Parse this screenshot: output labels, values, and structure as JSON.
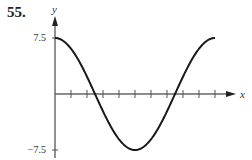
{
  "problem_number": "55.",
  "chart_data": {
    "type": "line",
    "title": "",
    "xlabel": "x",
    "ylabel": "y",
    "y_ticks": [
      {
        "value": 7.5,
        "label": "7.5"
      },
      {
        "value": -7.5,
        "label": "−7.5"
      }
    ],
    "x_tick_count": 10,
    "x_tick_labels": [],
    "ylim": [
      -7.5,
      7.5
    ],
    "xlim": [
      0,
      10
    ],
    "grid": false,
    "series": [
      {
        "name": "curve",
        "function": "y = 7.5 cos(pi x / 5)",
        "x": [
          0,
          1,
          2,
          2.5,
          3,
          4,
          5,
          6,
          7,
          7.5,
          8,
          9,
          10
        ],
        "values": [
          7.5,
          6.07,
          2.32,
          0,
          -2.32,
          -6.07,
          -7.5,
          -6.07,
          -2.32,
          0,
          2.32,
          6.07,
          7.5
        ]
      }
    ]
  }
}
